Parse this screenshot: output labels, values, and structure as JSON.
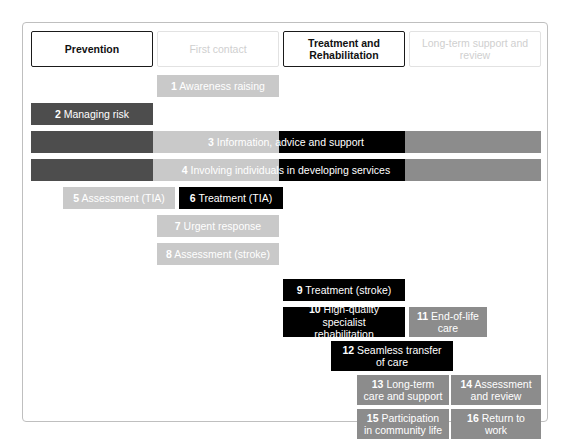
{
  "diagram": {
    "columns": [
      {
        "label": "Prevention",
        "emphasis": "strong"
      },
      {
        "label": "First contact",
        "emphasis": "faint"
      },
      {
        "label": "Treatment and\nRehabilitation",
        "emphasis": "strong"
      },
      {
        "label": "Long-term support and\nreview",
        "emphasis": "faint"
      }
    ],
    "colors": {
      "black": "#000000",
      "dark_grey": "#4d4d4d",
      "mid_grey": "#8c8c8c",
      "light_grey": "#c9c9c9",
      "pale_grey": "#d9d9d9",
      "frame_border": "#bfbfbf",
      "header_border_strong": "#1a1a1a",
      "header_border_faint": "#e2e2e2",
      "header_text_faint": "#cfcfcf",
      "bar_text": "#ffffff"
    },
    "items": [
      {
        "number": "1",
        "label": "Awareness raising",
        "tone": "light"
      },
      {
        "number": "2",
        "label": "Managing risk",
        "tone": "dark"
      },
      {
        "number": "3",
        "label": "Information, advice and support",
        "tone": "multi"
      },
      {
        "number": "4",
        "label": "Involving individuals in developing services",
        "tone": "multi"
      },
      {
        "number": "5",
        "label": "Assessment (TIA)",
        "tone": "light"
      },
      {
        "number": "6",
        "label": "Treatment (TIA)",
        "tone": "black"
      },
      {
        "number": "7",
        "label": "Urgent response",
        "tone": "light"
      },
      {
        "number": "8",
        "label": "Assessment (stroke)",
        "tone": "light"
      },
      {
        "number": "9",
        "label": "Treatment (stroke)",
        "tone": "black"
      },
      {
        "number": "10",
        "label": "High-quality specialist\nrehabilitation",
        "tone": "black"
      },
      {
        "number": "11",
        "label": "End-of-life\ncare",
        "tone": "mid"
      },
      {
        "number": "12",
        "label": "Seamless transfer\nof care",
        "tone": "black"
      },
      {
        "number": "13",
        "label": "Long-term\ncare and support",
        "tone": "mid"
      },
      {
        "number": "14",
        "label": "Assessment\nand review",
        "tone": "mid"
      },
      {
        "number": "15",
        "label": "Participation\nin community life",
        "tone": "mid"
      },
      {
        "number": "16",
        "label": "Return to\nwork",
        "tone": "mid"
      }
    ]
  }
}
